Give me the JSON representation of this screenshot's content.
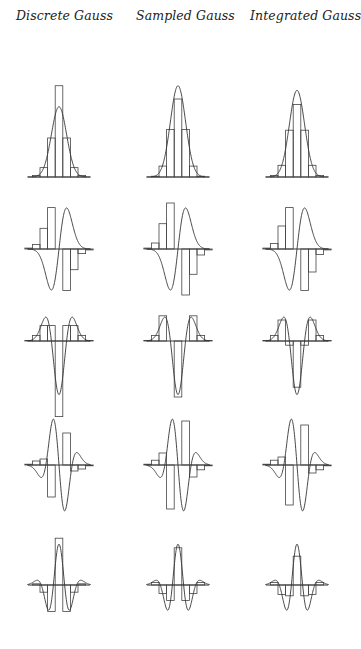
{
  "figure": {
    "column_titles": [
      "Discrete Gauss",
      "Sampled Gauss",
      "Integrated Gauss"
    ],
    "row_labels": [
      "order 0 (kernel)",
      "order 1 derivative",
      "order 2 derivative",
      "order 3 derivative",
      "order 4 derivative"
    ],
    "colors": {
      "ink": "#333333",
      "background": "#ffffff"
    }
  },
  "chart_data": {
    "type": "bar",
    "layout": {
      "rows": 5,
      "cols": 3,
      "grid": false,
      "axes": "horizontal zero line only",
      "legend": "none"
    },
    "columns": [
      "Discrete Gauss",
      "Sampled Gauss",
      "Integrated Gauss"
    ],
    "x": [
      -4,
      -3,
      -2,
      -1,
      0,
      1,
      2,
      3,
      4
    ],
    "note": "Each panel overlays a step (bar) plot of the discrete kernel on the continuous Gaussian derivative curve. Values normalized to the continuous curve's peak magnitude (=1).",
    "panels": [
      {
        "row": 0,
        "order": 0,
        "column": "Discrete Gauss",
        "bars": [
          0.0,
          0.02,
          0.12,
          0.5,
          1.17,
          0.5,
          0.12,
          0.02,
          0.0
        ]
      },
      {
        "row": 0,
        "order": 0,
        "column": "Sampled Gauss",
        "bars": [
          0.0,
          0.01,
          0.14,
          0.61,
          1.0,
          0.61,
          0.14,
          0.01,
          0.0
        ]
      },
      {
        "row": 0,
        "order": 0,
        "column": "Integrated Gauss",
        "bars": [
          0.0,
          0.02,
          0.15,
          0.6,
          0.93,
          0.6,
          0.15,
          0.02,
          0.0
        ]
      },
      {
        "row": 1,
        "order": 1,
        "column": "Discrete Gauss",
        "bars": [
          0.02,
          0.1,
          0.45,
          0.9,
          0,
          -0.9,
          -0.45,
          -0.1,
          -0.02
        ]
      },
      {
        "row": 1,
        "order": 1,
        "column": "Sampled Gauss",
        "bars": [
          0.02,
          0.13,
          0.55,
          1.0,
          0,
          -1.0,
          -0.55,
          -0.13,
          -0.02
        ]
      },
      {
        "row": 1,
        "order": 1,
        "column": "Integrated Gauss",
        "bars": [
          0.02,
          0.12,
          0.5,
          0.9,
          0,
          -0.9,
          -0.5,
          -0.12,
          -0.02
        ]
      },
      {
        "row": 2,
        "order": 2,
        "column": "Discrete Gauss",
        "bars": [
          0.02,
          0.2,
          0.55,
          0.55,
          -2.7,
          0.55,
          0.55,
          0.2,
          0.02
        ]
      },
      {
        "row": 2,
        "order": 2,
        "column": "Sampled Gauss",
        "bars": [
          0.02,
          0.2,
          0.9,
          0,
          -2.0,
          0,
          0.9,
          0.2,
          0.02
        ]
      },
      {
        "row": 2,
        "order": 2,
        "column": "Integrated Gauss",
        "bars": [
          0.02,
          0.2,
          0.75,
          -0.15,
          -1.65,
          -0.15,
          0.75,
          0.2,
          0.02
        ]
      },
      {
        "row": 3,
        "order": 3,
        "column": "Discrete Gauss",
        "bars": [
          0.02,
          0.1,
          0.15,
          -0.8,
          0,
          0.8,
          -0.15,
          -0.1,
          -0.02
        ]
      },
      {
        "row": 3,
        "order": 3,
        "column": "Sampled Gauss",
        "bars": [
          0.02,
          0.12,
          0.3,
          -1.1,
          0,
          1.1,
          -0.3,
          -0.12,
          -0.02
        ]
      },
      {
        "row": 3,
        "order": 3,
        "column": "Integrated Gauss",
        "bars": [
          0.02,
          0.12,
          0.2,
          -1.0,
          0,
          1.0,
          -0.2,
          -0.12,
          -0.02
        ]
      },
      {
        "row": 4,
        "order": 4,
        "column": "Discrete Gauss",
        "bars": [
          0.0,
          0.05,
          -0.3,
          -1.1,
          1.95,
          -1.1,
          -0.3,
          0.05,
          0.0
        ]
      },
      {
        "row": 4,
        "order": 4,
        "column": "Sampled Gauss",
        "bars": [
          0.0,
          0.1,
          -0.35,
          -0.65,
          1.55,
          -0.65,
          -0.35,
          0.1,
          0.0
        ]
      },
      {
        "row": 4,
        "order": 4,
        "column": "Integrated Gauss",
        "bars": [
          0.0,
          0.1,
          -0.4,
          -0.45,
          1.2,
          -0.45,
          -0.4,
          0.1,
          0.0
        ]
      }
    ]
  }
}
